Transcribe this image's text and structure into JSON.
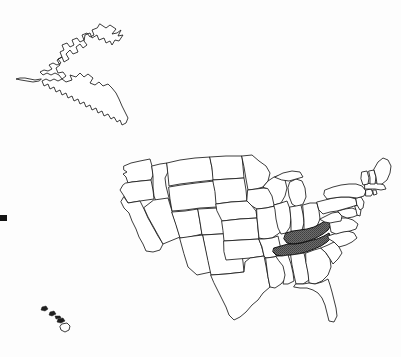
{
  "figure": {
    "title": "United States map with highlighted states",
    "background_color": "#fdfdfd",
    "outline_color": "#1a1a1a",
    "highlight_color": "#6a6a6a",
    "state_fill_color": "#ffffff",
    "width": 401,
    "height": 357
  },
  "legend": {
    "highlighted_label": "Highlighted states",
    "unhighlighted_label": "Other states"
  },
  "map": {
    "highlighted_states": [
      "Kentucky",
      "Tennessee"
    ],
    "insets": [
      {
        "name": "Alaska",
        "label": "Alaska"
      },
      {
        "name": "Hawaii",
        "label": "Hawaii"
      }
    ],
    "markers": [
      {
        "name": "left-edge-dot",
        "label": ""
      }
    ],
    "states": [
      {
        "name": "Washington",
        "abbr": "WA",
        "highlighted": false
      },
      {
        "name": "Oregon",
        "abbr": "OR",
        "highlighted": false
      },
      {
        "name": "California",
        "abbr": "CA",
        "highlighted": false
      },
      {
        "name": "Idaho",
        "abbr": "ID",
        "highlighted": false
      },
      {
        "name": "Nevada",
        "abbr": "NV",
        "highlighted": false
      },
      {
        "name": "Montana",
        "abbr": "MT",
        "highlighted": false
      },
      {
        "name": "Wyoming",
        "abbr": "WY",
        "highlighted": false
      },
      {
        "name": "Utah",
        "abbr": "UT",
        "highlighted": false
      },
      {
        "name": "Arizona",
        "abbr": "AZ",
        "highlighted": false
      },
      {
        "name": "Colorado",
        "abbr": "CO",
        "highlighted": false
      },
      {
        "name": "New Mexico",
        "abbr": "NM",
        "highlighted": false
      },
      {
        "name": "North Dakota",
        "abbr": "ND",
        "highlighted": false
      },
      {
        "name": "South Dakota",
        "abbr": "SD",
        "highlighted": false
      },
      {
        "name": "Nebraska",
        "abbr": "NE",
        "highlighted": false
      },
      {
        "name": "Kansas",
        "abbr": "KS",
        "highlighted": false
      },
      {
        "name": "Oklahoma",
        "abbr": "OK",
        "highlighted": false
      },
      {
        "name": "Texas",
        "abbr": "TX",
        "highlighted": false
      },
      {
        "name": "Minnesota",
        "abbr": "MN",
        "highlighted": false
      },
      {
        "name": "Iowa",
        "abbr": "IA",
        "highlighted": false
      },
      {
        "name": "Missouri",
        "abbr": "MO",
        "highlighted": false
      },
      {
        "name": "Arkansas",
        "abbr": "AR",
        "highlighted": false
      },
      {
        "name": "Louisiana",
        "abbr": "LA",
        "highlighted": false
      },
      {
        "name": "Wisconsin",
        "abbr": "WI",
        "highlighted": false
      },
      {
        "name": "Illinois",
        "abbr": "IL",
        "highlighted": false
      },
      {
        "name": "Michigan",
        "abbr": "MI",
        "highlighted": false
      },
      {
        "name": "Indiana",
        "abbr": "IN",
        "highlighted": false
      },
      {
        "name": "Ohio",
        "abbr": "OH",
        "highlighted": false
      },
      {
        "name": "Kentucky",
        "abbr": "KY",
        "highlighted": true
      },
      {
        "name": "Tennessee",
        "abbr": "TN",
        "highlighted": true
      },
      {
        "name": "Mississippi",
        "abbr": "MS",
        "highlighted": false
      },
      {
        "name": "Alabama",
        "abbr": "AL",
        "highlighted": false
      },
      {
        "name": "Georgia",
        "abbr": "GA",
        "highlighted": false
      },
      {
        "name": "Florida",
        "abbr": "FL",
        "highlighted": false
      },
      {
        "name": "South Carolina",
        "abbr": "SC",
        "highlighted": false
      },
      {
        "name": "North Carolina",
        "abbr": "NC",
        "highlighted": false
      },
      {
        "name": "Virginia",
        "abbr": "VA",
        "highlighted": false
      },
      {
        "name": "West Virginia",
        "abbr": "WV",
        "highlighted": false
      },
      {
        "name": "Maryland",
        "abbr": "MD",
        "highlighted": false
      },
      {
        "name": "Delaware",
        "abbr": "DE",
        "highlighted": false
      },
      {
        "name": "Pennsylvania",
        "abbr": "PA",
        "highlighted": false
      },
      {
        "name": "New Jersey",
        "abbr": "NJ",
        "highlighted": false
      },
      {
        "name": "New York",
        "abbr": "NY",
        "highlighted": false
      },
      {
        "name": "Connecticut",
        "abbr": "CT",
        "highlighted": false
      },
      {
        "name": "Rhode Island",
        "abbr": "RI",
        "highlighted": false
      },
      {
        "name": "Massachusetts",
        "abbr": "MA",
        "highlighted": false
      },
      {
        "name": "Vermont",
        "abbr": "VT",
        "highlighted": false
      },
      {
        "name": "New Hampshire",
        "abbr": "NH",
        "highlighted": false
      },
      {
        "name": "Maine",
        "abbr": "ME",
        "highlighted": false
      },
      {
        "name": "Alaska",
        "abbr": "AK",
        "highlighted": false
      },
      {
        "name": "Hawaii",
        "abbr": "HI",
        "highlighted": false
      }
    ]
  }
}
